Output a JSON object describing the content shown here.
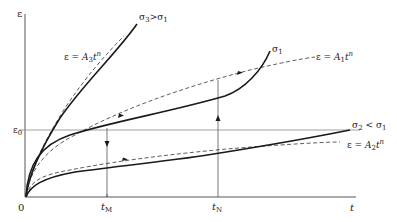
{
  "diagram": {
    "axes": {
      "y_label": "ε",
      "x_label": "t",
      "origin_label": "0",
      "epsilon0_label": "ε",
      "epsilon0_sub": "0",
      "tM_label": "t",
      "tM_sub": "M",
      "tN_label": "t",
      "tN_sub": "N"
    },
    "curves": {
      "sigma3": {
        "label_main": "σ",
        "label_sub": "3",
        "label_rel": ">σ",
        "label_sub2": "1"
      },
      "sigma1": {
        "label_main": "σ",
        "label_sub": "1"
      },
      "sigma2": {
        "label_main": "σ",
        "label_sub": "2",
        "label_rel": " < σ",
        "label_sub2": "1"
      }
    },
    "fits": {
      "A3": {
        "prefix": "ε = ",
        "A": "A",
        "sub": "3",
        "t": "t",
        "exp": "n"
      },
      "A1": {
        "prefix": "ε = ",
        "A": "A",
        "sub": "1",
        "t": "t",
        "exp": "n"
      },
      "A2": {
        "prefix": "ε = ",
        "A": "A",
        "sub": "2",
        "t": "t",
        "exp": "n"
      }
    },
    "colors": {
      "line": "#1a1a1a",
      "thin": "#555555",
      "background": "#ffffff"
    }
  }
}
